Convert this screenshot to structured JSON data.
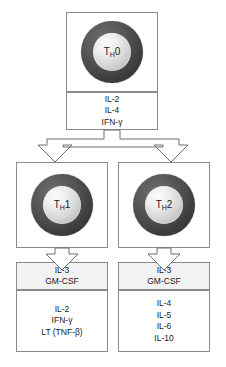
{
  "diagram": {
    "colors": {
      "cell_outer": "#3b3b3b",
      "cell_nucleus": "#d8d8d8",
      "box_border": "#8a8a8a",
      "box_shaded": "#f2f2f2",
      "background": "#ffffff",
      "text": "#1a1a1a"
    },
    "top": {
      "cell_label": "T",
      "cell_label_sub": "H",
      "cell_label_suffix": "0",
      "cell_name": "TH0",
      "cytokines": [
        "IL-2",
        "IL-4",
        "IFN-γ"
      ]
    },
    "left": {
      "cell_label": "T",
      "cell_label_sub": "H",
      "cell_label_suffix": "1",
      "cell_name": "TH1",
      "shared_cytokines": [
        "IL-3",
        "GM-CSF"
      ],
      "cytokines": [
        "IL-2",
        "IFN-γ",
        "LT  (TNF-β)"
      ]
    },
    "right": {
      "cell_label": "T",
      "cell_label_sub": "H",
      "cell_label_suffix": "2",
      "cell_name": "TH2",
      "shared_cytokines": [
        "IL-3",
        "GM-CSF"
      ],
      "cytokines": [
        "IL-4",
        "IL-5",
        "IL-6",
        "IL-10"
      ]
    },
    "arrows": {
      "split_arrow": "forked-down-arrow",
      "left_arrow": "down-arrow",
      "right_arrow": "down-arrow"
    }
  }
}
